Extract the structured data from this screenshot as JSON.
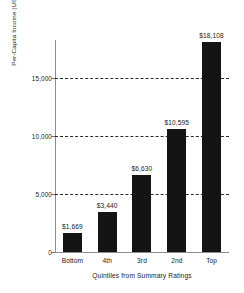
{
  "chart_data": {
    "type": "bar",
    "title": "",
    "xlabel": "Quintiles from Summary Ratings",
    "ylabel": "Per-Capita Income (US$, PPP)",
    "categories": [
      "Bottom",
      "4th",
      "3rd",
      "2nd",
      "Top"
    ],
    "values": [
      1669,
      3440,
      6630,
      10595,
      18108
    ],
    "value_labels": [
      "$1,669",
      "$3,440",
      "$6,630",
      "$10,595",
      "$18,108"
    ],
    "ylim": [
      0,
      18300
    ],
    "yticks": [
      0,
      5000,
      10000,
      15000
    ],
    "ytick_labels": [
      "0",
      "5,000",
      "10,000",
      "15,000"
    ],
    "gridlines": [
      5000,
      10000,
      15000
    ],
    "grid": true,
    "grid_style": "dashed",
    "legend": false,
    "bar_color": "#141414",
    "axis_color": "#8d8d8d"
  }
}
